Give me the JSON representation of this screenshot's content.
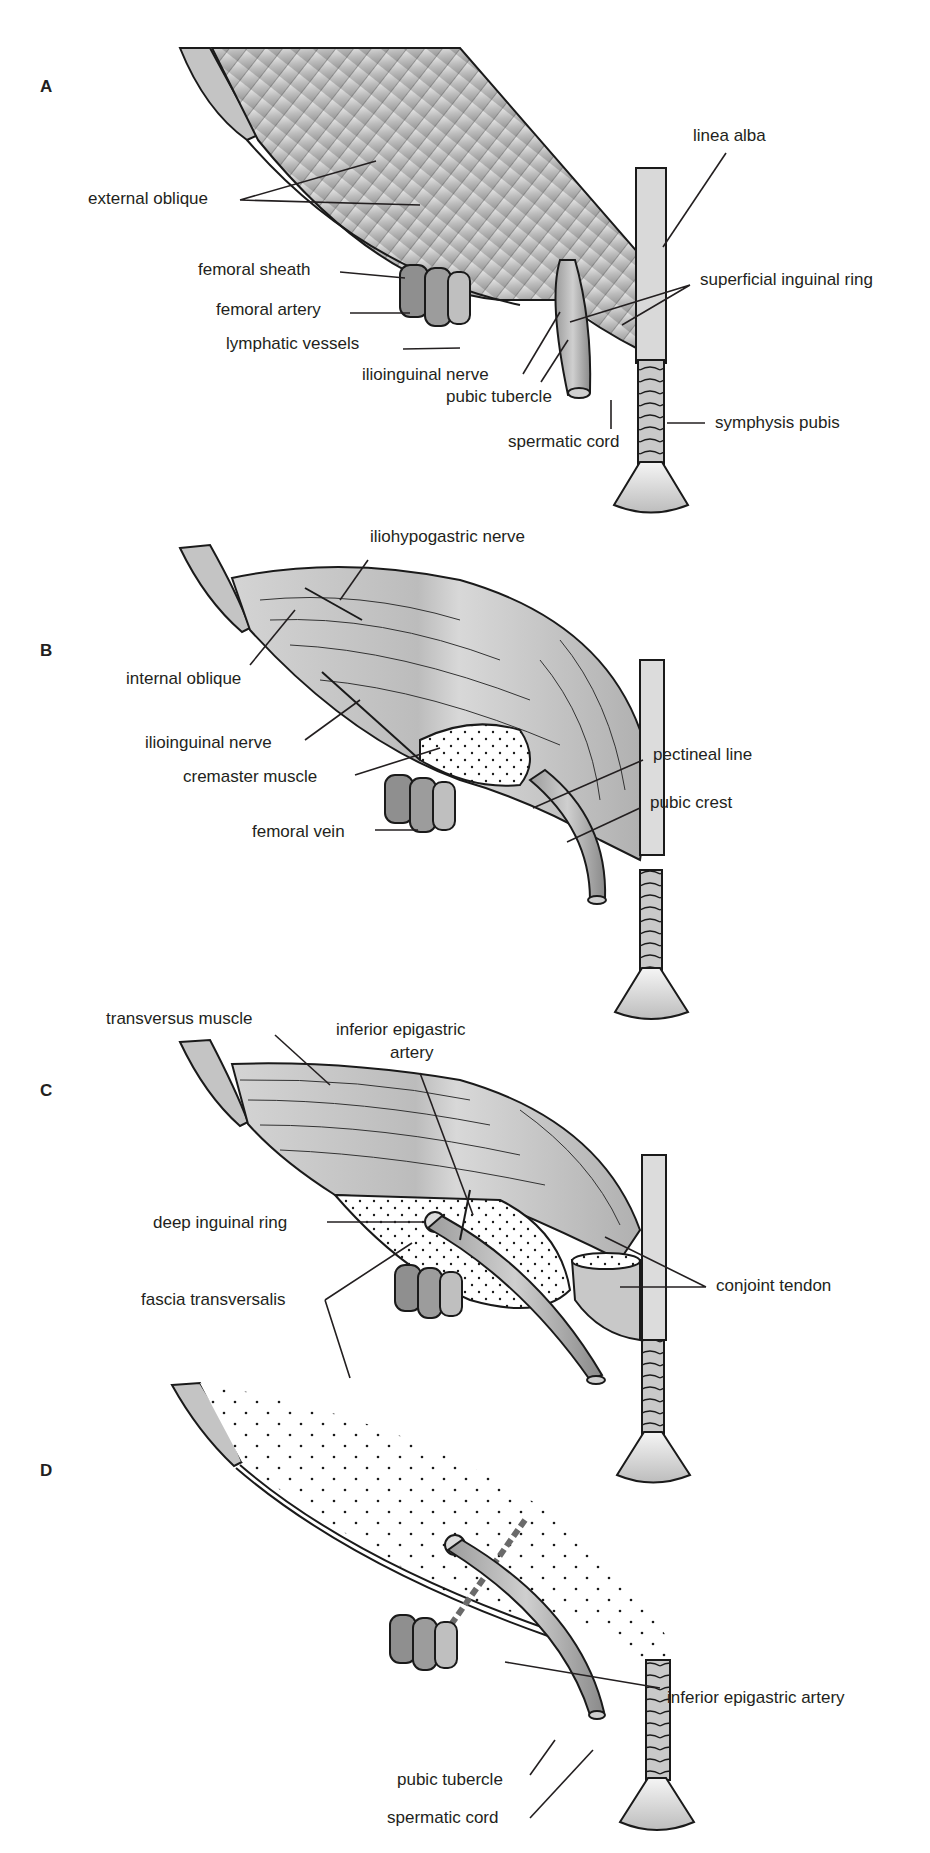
{
  "figure": {
    "panels": [
      {
        "letter": "A",
        "labels": [
          "external oblique",
          "femoral sheath",
          "femoral artery",
          "lymphatic vessels",
          "ilioinguinal nerve",
          "pubic tubercle",
          "spermatic cord",
          "linea alba",
          "superficial inguinal ring",
          "symphysis pubis"
        ]
      },
      {
        "letter": "B",
        "labels": [
          "iliohypogastric nerve",
          "internal oblique",
          "ilioinguinal nerve",
          "cremaster muscle",
          "femoral vein",
          "pectineal line",
          "pubic crest"
        ]
      },
      {
        "letter": "C",
        "labels": [
          "transversus muscle",
          "inferior epigastric",
          "artery",
          "deep inguinal ring",
          "fascia transversalis",
          "conjoint tendon"
        ]
      },
      {
        "letter": "D",
        "labels": [
          "inferior epigastric artery",
          "pubic tubercle",
          "spermatic cord"
        ]
      }
    ],
    "colors": {
      "muscle_light": "#d9d9d9",
      "muscle_mid": "#b8b8b8",
      "muscle_dark": "#8f8f8f",
      "fascia_dots": "#1a1a1a",
      "line": "#231f20",
      "background": "#ffffff"
    }
  }
}
